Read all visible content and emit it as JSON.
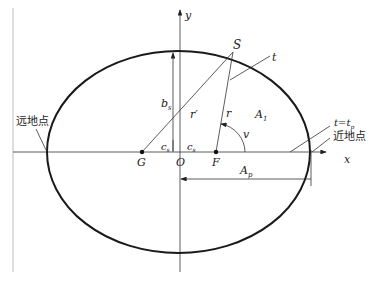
{
  "diagram": {
    "type": "orbital-ellipse",
    "axes": {
      "x_label": "x",
      "y_label": "y",
      "origin_label": "O"
    },
    "points": {
      "satellite": "S",
      "empty_focus": "G",
      "focus": "F"
    },
    "labels": {
      "semi_minor": "b",
      "semi_minor_sub": "s",
      "c_left": "c",
      "c_left_sub": "s",
      "c_right": "c",
      "c_right_sub": "s",
      "r_prime": "r′",
      "r": "r",
      "area": "A",
      "area_sub": "1",
      "true_anomaly": "v",
      "tangent": "t",
      "perigee_time": "t=t",
      "perigee_time_sub": "p",
      "perigee_distance": "A",
      "perigee_distance_sub": "p"
    },
    "annotations": {
      "apogee": "远地点",
      "perigee": "近地点"
    },
    "colors": {
      "curve": "#1a1a1a",
      "axis": "#333333",
      "frame": "#bdbdbd"
    }
  }
}
